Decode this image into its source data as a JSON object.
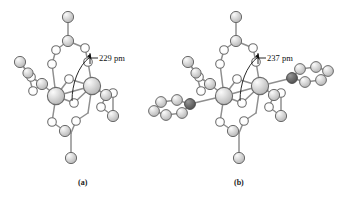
{
  "figure": {
    "background_color": "#ffffff",
    "width": 339,
    "height": 200
  },
  "palette": {
    "sphere_light_fill": "#cfcfcf",
    "sphere_light_highlight": "#f2f2f2",
    "sphere_open_fill": "#ffffff",
    "sphere_dark_fill": "#6e6e6e",
    "outline": "#6a6a6a",
    "bond": "#8c8c8c",
    "text": "#111111"
  },
  "panels": [
    {
      "id": "panel-a",
      "caption": "(a)",
      "dimension_label": "229 pm",
      "dimension_value": 229,
      "dimension_unit": "pm",
      "has_side_rings": false
    },
    {
      "id": "panel-b",
      "caption": "(b)",
      "dimension_label": "237 pm",
      "dimension_value": 237,
      "dimension_unit": "pm",
      "has_side_rings": true
    }
  ],
  "legend": {
    "large_sphere_meaning": "metal-atom",
    "small_shaded_sphere_meaning": "shaded-atom",
    "open_circle_meaning": "open-circle-atom",
    "dark_sphere_meaning": "dark-atom"
  }
}
